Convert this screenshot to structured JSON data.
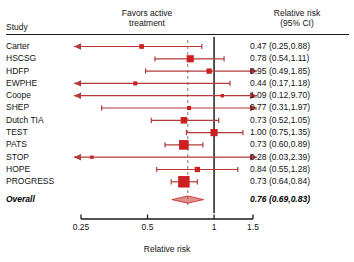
{
  "header": {
    "study_label": "Study",
    "favors_label": "Favors active treatment",
    "rr_label": "Relative risk (95% CI)",
    "rr_label_line1": "Relative risk",
    "rr_label_line2": "(95% CI)",
    "favors_line1": "Favors active",
    "favors_line2": "treatment"
  },
  "axis": {
    "title": "Relative risk",
    "scale": "log",
    "ticks": [
      0.25,
      0.5,
      1,
      1.5
    ],
    "tick_labels": [
      "0.25",
      "0.5",
      "1",
      "1.5"
    ],
    "xmin": 0.25,
    "xmax": 1.5,
    "null_line": 1,
    "summary_line": 0.76
  },
  "colors": {
    "marker": "#cc1f1f",
    "line": "#b23a3a",
    "axis": "#1a1a1a",
    "null_line": "#2b2b2b",
    "summary_dash": "#9a9a9a",
    "diamond": "#c0392b"
  },
  "chart_data": {
    "type": "forest",
    "title": "",
    "xlabel": "Relative risk",
    "ylabel": "Study",
    "xlim": [
      0.25,
      1.5
    ],
    "scale": "log",
    "reference_line": 1,
    "studies": [
      {
        "name": "Carter",
        "rr": 0.47,
        "lcl": 0.25,
        "ucl": 0.88,
        "label": "0.47 (0.25,0.88)",
        "weight": 4,
        "arrow_left": true,
        "arrow_right": false
      },
      {
        "name": "HSCSG",
        "rr": 0.78,
        "lcl": 0.54,
        "ucl": 1.11,
        "label": "0.78 (0.54,1.11)",
        "weight": 8,
        "arrow_left": false,
        "arrow_right": false
      },
      {
        "name": "HDFP",
        "rr": 0.95,
        "lcl": 0.49,
        "ucl": 1.85,
        "label": "0.95 (0.49,1.85)",
        "weight": 5,
        "arrow_left": false,
        "arrow_right": true
      },
      {
        "name": "EWPHE",
        "rr": 0.44,
        "lcl": 0.17,
        "ucl": 1.18,
        "label": "0.44 (0.17,1.18)",
        "weight": 3,
        "arrow_left": true,
        "arrow_right": false
      },
      {
        "name": "Coope",
        "rr": 1.09,
        "lcl": 0.12,
        "ucl": 9.7,
        "label": "1.09 (0.12,9.70)",
        "weight": 2,
        "arrow_left": true,
        "arrow_right": true
      },
      {
        "name": "SHEP",
        "rr": 0.77,
        "lcl": 0.31,
        "ucl": 1.97,
        "label": "0.77 (0.31,1.97)",
        "weight": 3,
        "arrow_left": false,
        "arrow_right": true
      },
      {
        "name": "Dutch TIA",
        "rr": 0.73,
        "lcl": 0.52,
        "ucl": 1.05,
        "label": "0.73 (0.52,1.05)",
        "weight": 7,
        "arrow_left": false,
        "arrow_right": false
      },
      {
        "name": "TEST",
        "rr": 1.0,
        "lcl": 0.75,
        "ucl": 1.35,
        "label": "1.00 (0.75,1.35)",
        "weight": 8,
        "arrow_left": false,
        "arrow_right": false
      },
      {
        "name": "PATS",
        "rr": 0.73,
        "lcl": 0.6,
        "ucl": 0.89,
        "label": "0.73 (0.60,0.89)",
        "weight": 12,
        "arrow_left": false,
        "arrow_right": false
      },
      {
        "name": "STOP",
        "rr": 0.28,
        "lcl": 0.03,
        "ucl": 2.39,
        "label": "0.28 (0.03,2.39)",
        "weight": 2,
        "arrow_left": true,
        "arrow_right": true
      },
      {
        "name": "HOPE",
        "rr": 0.84,
        "lcl": 0.55,
        "ucl": 1.28,
        "label": "0.84 (0.55,1.28)",
        "weight": 5,
        "arrow_left": false,
        "arrow_right": false
      },
      {
        "name": "PROGRESS",
        "rr": 0.73,
        "lcl": 0.64,
        "ucl": 0.84,
        "label": "0.73 (0.64,0.84)",
        "weight": 15,
        "arrow_left": false,
        "arrow_right": false
      }
    ],
    "overall": {
      "name": "Overall",
      "rr": 0.76,
      "lcl": 0.69,
      "ucl": 0.83,
      "label": "0.76 (0.69,0.83)"
    }
  }
}
